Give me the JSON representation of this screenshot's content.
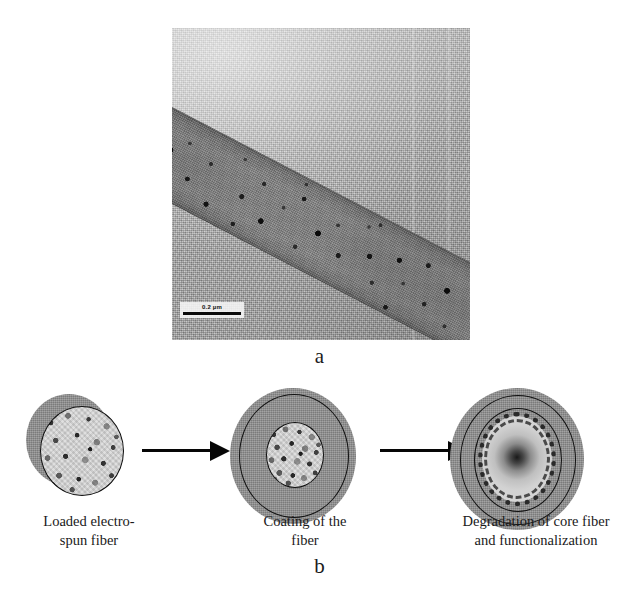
{
  "figure": {
    "panels": [
      {
        "letter": "a",
        "kind": "tem-micrograph",
        "description": "Transmission electron micrograph of a loaded electrospun nanofiber",
        "scalebar": {
          "value": "0.2",
          "unit": "µm",
          "label": "0.2 µm"
        }
      },
      {
        "letter": "b",
        "kind": "process-schematic",
        "stages": [
          {
            "id": "loaded-electrospun-fiber",
            "caption_lines": [
              "Loaded electro-",
              "spun fiber"
            ],
            "caption": "Loaded electro-spun fiber"
          },
          {
            "id": "coating-of-the-fiber",
            "caption_lines": [
              "Coating of the",
              "fiber"
            ],
            "caption": "Coating of the fiber"
          },
          {
            "id": "degradation-and-functionalization",
            "caption_lines": [
              "Degradation of core fiber",
              "and functionalization"
            ],
            "caption": "Degradation of core fiber and functionalization"
          }
        ],
        "arrows": [
          {
            "id": "arrow-stage1-to-stage2",
            "direction": "right"
          },
          {
            "id": "arrow-stage2-to-stage3",
            "direction": "right"
          }
        ]
      }
    ],
    "colors": {
      "shell_gray": "#8f8f8f",
      "outline_black": "#111111",
      "core_light": "#d8d8d8",
      "background": "#ffffff",
      "micrograph_gray": "#b4b4b4",
      "fiber_gray": "#8e8e8e"
    }
  }
}
